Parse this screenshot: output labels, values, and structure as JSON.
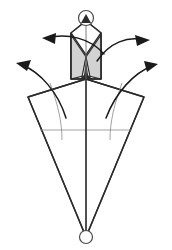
{
  "figure": {
    "title": "Collapsible umbrella canopy deployment diagram",
    "caption": "",
    "background_color": "#ffffff",
    "line_color": "#2b2b2b",
    "thin_line_color": "#8a8a8a",
    "shade_color": "#d2d2d2",
    "shade_color_dark": "#bdbdbd",
    "arrow_color": "#1a1a1a"
  },
  "geometry": {
    "canvas": {
      "width": 172,
      "height": 250
    },
    "top_hub": {
      "cx": 86,
      "cy": 18,
      "r": 7.5
    },
    "bottom_hub": {
      "cx": 86,
      "cy": 237,
      "r": 6.5
    },
    "apex_point": {
      "x": 86,
      "y": 21
    },
    "shaft": {
      "x1": 86,
      "y1": 21,
      "x2": 86,
      "y2": 237
    },
    "ferrule_left": 71,
    "ferrule_right": 101,
    "ferrule_top": 33,
    "ferrule_bottom": 79,
    "canopy_peak": {
      "x": 86,
      "y": 79
    },
    "canopy_left_corner": {
      "x": 28,
      "y": 97
    },
    "canopy_right_corner": {
      "x": 144,
      "y": 97
    },
    "canopy_tip": {
      "x": 86,
      "y": 237
    },
    "rib_line_y": 130
  },
  "parts": [
    {
      "id": "top-hub",
      "name": "top-hub-ring",
      "label": ""
    },
    {
      "id": "tip-cap",
      "name": "tip-cap",
      "label": ""
    },
    {
      "id": "ferrule",
      "name": "ferrule-tube",
      "label": ""
    },
    {
      "id": "left-shade-panel",
      "name": "folded-panel-left",
      "label": ""
    },
    {
      "id": "right-shade-panel",
      "name": "folded-panel-right",
      "label": ""
    },
    {
      "id": "canopy",
      "name": "canopy-outline",
      "label": ""
    },
    {
      "id": "bottom-hub",
      "name": "runner-hub-ring",
      "label": ""
    }
  ],
  "arrows": [
    {
      "id": "arrow-upper-left",
      "name": "motion-arrow-upper-left",
      "direction": "left",
      "path": "M 104 54 C 90 38 68 33 46 38",
      "head": "42,38 56,33 55,44",
      "label": ""
    },
    {
      "id": "arrow-upper-right",
      "name": "motion-arrow-upper-right",
      "direction": "right",
      "path": "M 97 61 C 110 42 128 36 144 40",
      "head": "150,40 135,35 137,46",
      "label": ""
    },
    {
      "id": "arrow-lower-left",
      "name": "motion-arrow-lower-left",
      "direction": "left",
      "path": "M 66 118 C 58 92 40 72 22 65",
      "head": "16,63 31,60 27,71",
      "label": ""
    },
    {
      "id": "arrow-lower-right",
      "name": "motion-arrow-lower-right",
      "direction": "right",
      "path": "M 106 118 C 116 92 134 73 152 66",
      "head": "158,64 144,61 147,72",
      "label": ""
    }
  ]
}
